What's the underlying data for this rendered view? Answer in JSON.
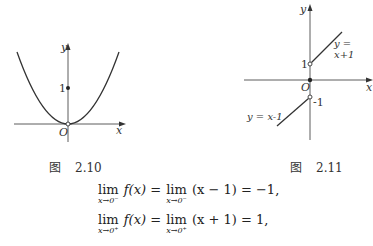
{
  "figures": [
    {
      "caption_prefix": "图",
      "caption_number": "2.10",
      "axis_x_label": "x",
      "axis_y_label": "y",
      "origin_label": "O",
      "y_tick_label": "1",
      "description": "parabola y=x^2 with open circle at origin and filled point at (0,1)"
    },
    {
      "caption_prefix": "图",
      "caption_number": "2.11",
      "axis_x_label": "x",
      "axis_y_label": "y",
      "origin_label": "O",
      "y_tick_pos_label": "1",
      "y_tick_neg_label": "-1",
      "upper_line_label": "y = x+1",
      "lower_line_label": "y = x-1",
      "description": "piecewise lines with open circles at (0,1) and (0,-1), filled point at origin"
    }
  ],
  "equations": [
    {
      "lim": "lim",
      "sub": "x→0⁻",
      "lhs": "f(x) =",
      "lim2": "lim",
      "sub2": "x→0⁻",
      "rhs": "(x − 1) = −1,"
    },
    {
      "lim": "lim",
      "sub": "x→0⁺",
      "lhs": "f(x) =",
      "lim2": "lim",
      "sub2": "x→0⁺",
      "rhs": "(x + 1) = 1,"
    }
  ]
}
